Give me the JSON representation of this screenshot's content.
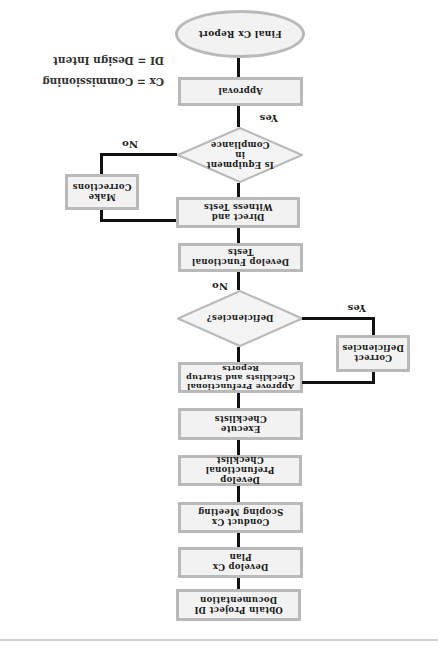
{
  "orientation": "rotated-180",
  "flowchart": {
    "steps": [
      {
        "id": "obtain",
        "label": "Obtain Project DI Documentation"
      },
      {
        "id": "cx-plan",
        "label": "Develop Cx Plan"
      },
      {
        "id": "scoping",
        "label": "Conduct Cx Scoping Meeting"
      },
      {
        "id": "prefunctional",
        "label": "Develop Prefunctional Checklist"
      },
      {
        "id": "execute",
        "label": "Execute Checklists"
      },
      {
        "id": "approve",
        "label": "Approve Prefunctional Checklists and Startup Reports"
      },
      {
        "id": "deficiencies",
        "label": "Deficiencies?",
        "type": "decision"
      },
      {
        "id": "correct",
        "label": "Correct Deficiencies"
      },
      {
        "id": "functional",
        "label": "Develop Functional Tests"
      },
      {
        "id": "witness",
        "label": "Direct and Witness Tests"
      },
      {
        "id": "compliance",
        "label": "Is Equipment in Compliance",
        "type": "decision"
      },
      {
        "id": "corrections",
        "label": "Make Corrections"
      },
      {
        "id": "approval",
        "label": "Approval"
      },
      {
        "id": "final",
        "label": "Final Cx Report",
        "type": "terminal"
      }
    ],
    "edge_labels": {
      "deficiencies_yes": "Yes",
      "deficiencies_no": "No",
      "compliance_yes": "Yes",
      "compliance_no": "No"
    }
  },
  "legend": {
    "cx": "Cx = Commissioning",
    "di": "DI = Design Intent"
  },
  "colors": {
    "box_fill": "#f2f2f2",
    "box_border": "#b9b9b9",
    "connector": "#111111"
  }
}
